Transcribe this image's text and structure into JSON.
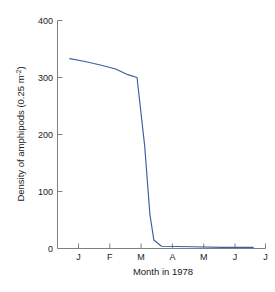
{
  "chart_data": {
    "type": "line",
    "title": "",
    "xlabel": "Month in 1978",
    "ylabel": "Density of amphipods (0.25 m",
    "ylabel_superscript": "-2",
    "ylabel_suffix": ")",
    "ylabel_full": "Density of amphipods (0.25 m-2)",
    "xtick_labels": [
      "J",
      "F",
      "M",
      "A",
      "M",
      "J",
      "J"
    ],
    "xtick_full_names": [
      "January",
      "February",
      "March",
      "April",
      "May",
      "June",
      "July"
    ],
    "ytick_labels": [
      "0",
      "100",
      "200",
      "300",
      "400"
    ],
    "ytick_values": [
      0,
      100,
      200,
      300,
      400
    ],
    "ylim": [
      0,
      400
    ],
    "xlim": [
      0.6,
      7.4
    ],
    "grid": false,
    "legend": false,
    "line_color": "#3a5f9f",
    "axis_color": "#808080",
    "text_color": "#1a1a1a",
    "background": "#ffffff",
    "series": [
      {
        "name": "Density of amphipods",
        "x": [
          1.0,
          1.5,
          2.0,
          2.5,
          2.9,
          3.2,
          3.45,
          3.62,
          3.75,
          4.0,
          5.0,
          6.0,
          7.0
        ],
        "values": [
          333,
          328,
          322,
          315,
          305,
          300,
          180,
          60,
          15,
          4,
          3,
          2,
          2
        ]
      }
    ]
  }
}
